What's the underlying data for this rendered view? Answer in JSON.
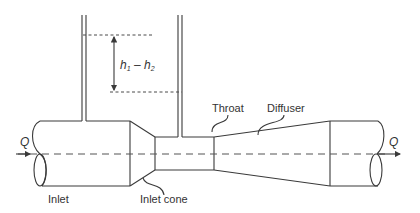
{
  "diagram": {
    "labels": {
      "flow_in": "Q",
      "flow_out": "Q",
      "inlet": "Inlet",
      "inlet_cone": "Inlet cone",
      "throat": "Throat",
      "diffuser": "Diffuser",
      "head_diff_h1": "h",
      "head_diff_sub1": "1",
      "head_diff_minus": " – ",
      "head_diff_h2": "h",
      "head_diff_sub2": "2"
    },
    "colors": {
      "line": "#3a3a3a",
      "text": "#333333",
      "background": "#ffffff"
    }
  }
}
